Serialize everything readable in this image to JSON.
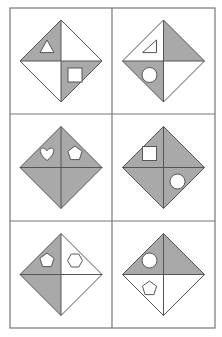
{
  "puzzle": {
    "description": "Figure reasoning puzzle: 3x2 grid of diamonds split into four triangular quadrants with shaded regions and small outlined shapes",
    "colors": {
      "background": "#ffffff",
      "shade": "#a9a9a9",
      "line": "#555555",
      "grid": "#777777"
    },
    "cells": [
      {
        "row": 0,
        "col": 0,
        "shaded": [
          "top-left",
          "bottom-right"
        ],
        "shapes": [
          {
            "type": "triangle",
            "quadrant": "top-left"
          },
          {
            "type": "square",
            "quadrant": "bottom-right"
          }
        ]
      },
      {
        "row": 0,
        "col": 1,
        "shaded": [
          "top-right",
          "bottom-left"
        ],
        "shapes": [
          {
            "type": "right-triangle",
            "quadrant": "top-left"
          },
          {
            "type": "circle",
            "quadrant": "bottom-left"
          }
        ]
      },
      {
        "row": 1,
        "col": 0,
        "shaded": [
          "top-left",
          "top-right",
          "bottom-left",
          "bottom-right"
        ],
        "shapes": [
          {
            "type": "heart",
            "quadrant": "top-left"
          },
          {
            "type": "pentagon",
            "quadrant": "top-right"
          }
        ]
      },
      {
        "row": 1,
        "col": 1,
        "shaded": [
          "top-left",
          "top-right",
          "bottom-left",
          "bottom-right"
        ],
        "shapes": [
          {
            "type": "square",
            "quadrant": "top-left"
          },
          {
            "type": "circle",
            "quadrant": "bottom-right"
          }
        ]
      },
      {
        "row": 2,
        "col": 0,
        "shaded": [
          "top-left",
          "bottom-left"
        ],
        "shapes": [
          {
            "type": "pentagon",
            "quadrant": "top-left"
          },
          {
            "type": "hexagon",
            "quadrant": "top-right"
          }
        ]
      },
      {
        "row": 2,
        "col": 1,
        "shaded": [
          "top-left",
          "top-right"
        ],
        "shapes": [
          {
            "type": "circle",
            "quadrant": "top-left"
          },
          {
            "type": "pentagon",
            "quadrant": "bottom-left"
          }
        ]
      }
    ]
  }
}
